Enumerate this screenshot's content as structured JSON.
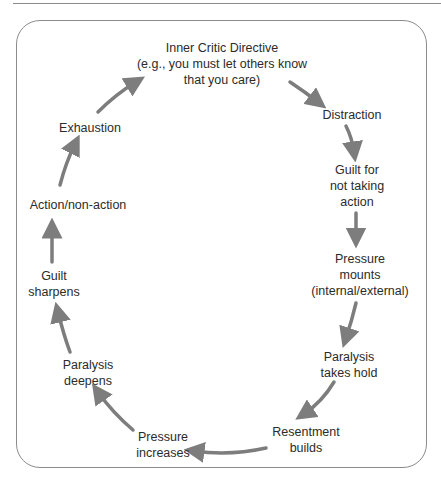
{
  "diagram": {
    "type": "cycle",
    "arrow_color": "#7d7d7d",
    "nodes": [
      {
        "id": "inner-critic-directive",
        "label": "Inner Critic Directive\n(e.g., you must let others know\nthat you care)"
      },
      {
        "id": "distraction",
        "label": "Distraction"
      },
      {
        "id": "guilt-for-not-taking-action",
        "label": "Guilt for\nnot taking\naction"
      },
      {
        "id": "pressure-mounts",
        "label": "Pressure\nmounts\n(internal/external)"
      },
      {
        "id": "paralysis-takes-hold",
        "label": "Paralysis\ntakes hold"
      },
      {
        "id": "resentment-builds",
        "label": "Resentment\nbuilds"
      },
      {
        "id": "pressure-increases",
        "label": "Pressure\nincreases"
      },
      {
        "id": "paralysis-deepens",
        "label": "Paralysis\ndeepens"
      },
      {
        "id": "guilt-sharpens",
        "label": "Guilt\nsharpens"
      },
      {
        "id": "action-non-action",
        "label": "Action/non-action"
      },
      {
        "id": "exhaustion",
        "label": "Exhaustion"
      }
    ],
    "edges": [
      [
        "inner-critic-directive",
        "distraction"
      ],
      [
        "distraction",
        "guilt-for-not-taking-action"
      ],
      [
        "guilt-for-not-taking-action",
        "pressure-mounts"
      ],
      [
        "pressure-mounts",
        "paralysis-takes-hold"
      ],
      [
        "paralysis-takes-hold",
        "resentment-builds"
      ],
      [
        "resentment-builds",
        "pressure-increases"
      ],
      [
        "pressure-increases",
        "paralysis-deepens"
      ],
      [
        "paralysis-deepens",
        "guilt-sharpens"
      ],
      [
        "guilt-sharpens",
        "action-non-action"
      ],
      [
        "action-non-action",
        "exhaustion"
      ],
      [
        "exhaustion",
        "inner-critic-directive"
      ]
    ]
  }
}
